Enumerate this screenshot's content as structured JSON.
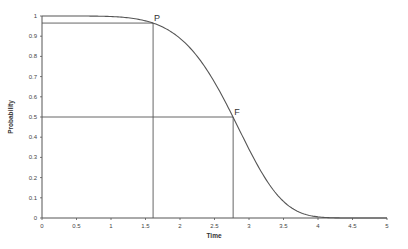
{
  "chart_data": {
    "type": "line",
    "title": "",
    "xlabel": "Time",
    "ylabel": "Probability",
    "xlim": [
      0,
      5
    ],
    "ylim": [
      0,
      1
    ],
    "x_ticks": [
      0,
      0.5,
      1,
      1.5,
      2,
      2.5,
      3,
      3.5,
      4,
      4.5,
      5
    ],
    "x_tick_labels": [
      "0",
      "0.5",
      "1",
      "1.5",
      "2",
      "2.5",
      "3",
      "3.5",
      "4",
      "4.5",
      "5"
    ],
    "y_ticks": [
      0,
      0.1,
      0.2,
      0.3,
      0.4,
      0.5,
      0.6,
      0.7,
      0.8,
      0.9,
      1
    ],
    "y_tick_labels": [
      "0",
      "0.1",
      "0.2",
      "0.3",
      "0.4",
      "0.5",
      "0.6",
      "0.7",
      "0.8",
      "0.9",
      "1"
    ],
    "grid": false,
    "legend": null,
    "series": [
      {
        "name": "Reliability curve",
        "color": "#555555",
        "x": [
          0,
          0.25,
          0.5,
          0.75,
          1.0,
          1.25,
          1.5,
          1.61,
          1.75,
          2.0,
          2.25,
          2.5,
          2.77,
          3.0,
          3.25,
          3.5,
          3.75,
          4.0,
          4.25,
          4.5,
          4.75,
          5.0
        ],
        "y": [
          1.0,
          1.0,
          1.0,
          0.998,
          0.997,
          0.99,
          0.976,
          0.965,
          0.947,
          0.88,
          0.776,
          0.64,
          0.5,
          0.33,
          0.19,
          0.09,
          0.035,
          0.011,
          0.003,
          0.0005,
          0.0,
          0.0
        ]
      }
    ],
    "annotations": [
      {
        "label": "P",
        "x": 1.61,
        "y": 0.965
      },
      {
        "label": "F",
        "x": 2.77,
        "y": 0.5
      }
    ]
  },
  "colors": {
    "axis": "#555555",
    "curve": "#555555",
    "guide": "#555555",
    "text": "#444444"
  }
}
